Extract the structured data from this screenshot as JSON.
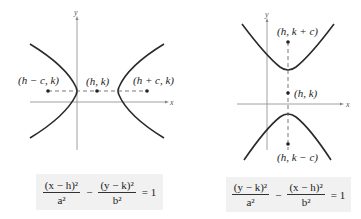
{
  "left_graph": {
    "axis_x_label": "x",
    "axis_y_label": "y",
    "points": [
      {
        "label": "(h − c, k)",
        "role": "focus"
      },
      {
        "label": "(h, k)",
        "role": "center"
      },
      {
        "label": "(h + c, k)",
        "role": "focus"
      }
    ],
    "orientation": "horizontal transverse axis"
  },
  "right_graph": {
    "axis_x_label": "x",
    "axis_y_label": "y",
    "points": [
      {
        "label": "(h, k + c)",
        "role": "focus"
      },
      {
        "label": "(h, k)",
        "role": "center"
      },
      {
        "label": "(h, k − c)",
        "role": "focus"
      }
    ],
    "orientation": "vertical transverse axis"
  },
  "equations": {
    "left": {
      "term1_num": "(x − h)²",
      "term1_den": "a²",
      "minus": "−",
      "term2_num": "(y − k)²",
      "term2_den": "b²",
      "rhs": "= 1"
    },
    "right": {
      "term1_num": "(y − k)²",
      "term1_den": "a²",
      "minus": "−",
      "term2_num": "(x − h)²",
      "term2_den": "b²",
      "rhs": "= 1"
    }
  },
  "colors": {
    "curve": "#2a2a2a",
    "axis": "#888888",
    "equation_bg": "#f1f1f1"
  }
}
